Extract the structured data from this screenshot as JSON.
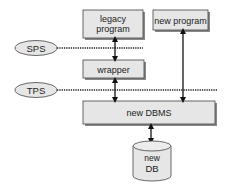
{
  "diagram": {
    "boxes": {
      "legacy_program": {
        "line1": "legacy",
        "line2": "program"
      },
      "new_program": {
        "label": "new program"
      },
      "wrapper": {
        "label": "wrapper"
      },
      "new_dbms": {
        "label": "new DBMS"
      }
    },
    "database": {
      "line1": "new",
      "line2": "DB"
    },
    "levels": {
      "sps": {
        "label": "SPS"
      },
      "tps": {
        "label": "TPS"
      }
    },
    "colors": {
      "box_fill": "#e6e6e6",
      "box_border": "#444444",
      "arrow": "#111111",
      "dotted_line": "#222222"
    }
  }
}
